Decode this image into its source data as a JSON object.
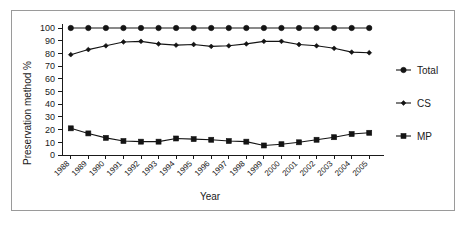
{
  "chart_data": {
    "type": "line",
    "title": "",
    "xlabel": "Year",
    "ylabel": "Preservation method %",
    "categories": [
      "1988",
      "1989",
      "1990",
      "1991",
      "1992",
      "1993",
      "1994",
      "1995",
      "1996",
      "1997",
      "1998",
      "1999",
      "2000",
      "2001",
      "2002",
      "2003",
      "2004",
      "2005"
    ],
    "series": [
      {
        "name": "Total",
        "marker": "filled-circle",
        "values": [
          100,
          100,
          100,
          100,
          100,
          100,
          100,
          100,
          100,
          100,
          100,
          100,
          100,
          100,
          100,
          100,
          100,
          100
        ]
      },
      {
        "name": "CS",
        "marker": "filled-diamond",
        "values": [
          79,
          83,
          86,
          89,
          89.5,
          87.5,
          86.5,
          87,
          85.5,
          86,
          87.5,
          89.5,
          89.5,
          87,
          86,
          84,
          81,
          80.5
        ]
      },
      {
        "name": "MP",
        "marker": "filled-square",
        "values": [
          21,
          17,
          13.5,
          11,
          10.5,
          10.5,
          13,
          12.5,
          12,
          11,
          10.5,
          7.5,
          8.5,
          10,
          12,
          14,
          16.5,
          17.5
        ]
      }
    ],
    "ylim": [
      0,
      100
    ],
    "ytick_step": 10,
    "yticks": [
      "0",
      "10",
      "20",
      "30",
      "40",
      "50",
      "60",
      "70",
      "80",
      "90",
      "100"
    ],
    "grid": false,
    "legend_position": "right",
    "xtick_rotation_deg": 45,
    "colors": {
      "line": "#141414",
      "axis": "#1a1a1a",
      "frame": "#9a9a9a",
      "background": "#ffffff"
    }
  },
  "legend": {
    "items": [
      {
        "label": "Total",
        "marker": "filled-circle"
      },
      {
        "label": "CS",
        "marker": "filled-diamond"
      },
      {
        "label": "MP",
        "marker": "filled-square"
      }
    ]
  },
  "axes": {
    "y_title": "Preservation method %",
    "x_title": "Year"
  }
}
